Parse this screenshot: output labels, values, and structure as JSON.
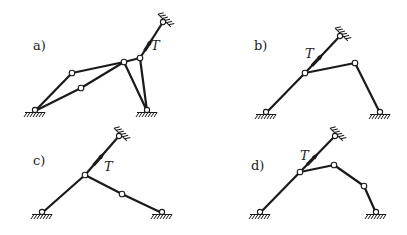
{
  "figure": {
    "panels": [
      {
        "id": "a",
        "label": "a)",
        "label_pos": [
          33,
          50
        ],
        "force_label": "T",
        "force_label_pos": [
          151,
          50
        ],
        "top_support": [
          163,
          22
        ],
        "links": [
          [
            [
              35,
              111
            ],
            [
              72,
              73
            ]
          ],
          [
            [
              72,
              73
            ],
            [
              124,
              62
            ]
          ],
          [
            [
              35,
              111
            ],
            [
              81,
              88
            ]
          ],
          [
            [
              81,
              88
            ],
            [
              124,
              62
            ]
          ],
          [
            [
              124,
              62
            ],
            [
              147,
              111
            ]
          ],
          [
            [
              140,
              58
            ],
            [
              147,
              111
            ]
          ],
          [
            [
              124,
              62
            ],
            [
              140,
              58
            ]
          ],
          [
            [
              140,
              58
            ],
            [
              163,
              22
            ]
          ]
        ],
        "joints": [
          [
            72,
            73
          ],
          [
            81,
            88
          ],
          [
            124,
            62
          ],
          [
            140,
            58
          ]
        ],
        "grounds": [
          [
            35,
            111
          ],
          [
            147,
            111
          ]
        ],
        "arrow": {
          "from": [
            140,
            58
          ],
          "to": [
            163,
            22
          ],
          "t": 0.45
        }
      },
      {
        "id": "b",
        "label": "b)",
        "label_pos": [
          254,
          50
        ],
        "force_label": "T",
        "force_label_pos": [
          305,
          58
        ],
        "top_support": [
          340,
          36
        ],
        "links": [
          [
            [
              266,
              113
            ],
            [
              305,
              73
            ]
          ],
          [
            [
              305,
              73
            ],
            [
              340,
              36
            ]
          ],
          [
            [
              305,
              73
            ],
            [
              355,
              63
            ]
          ],
          [
            [
              355,
              63
            ],
            [
              380,
              113
            ]
          ]
        ],
        "joints": [
          [
            305,
            73
          ],
          [
            355,
            63
          ]
        ],
        "grounds": [
          [
            266,
            113
          ],
          [
            380,
            113
          ]
        ],
        "arrow": {
          "from": [
            305,
            73
          ],
          "to": [
            340,
            36
          ],
          "t": 0.45
        }
      },
      {
        "id": "c",
        "label": "c)",
        "label_pos": [
          33,
          165
        ],
        "force_label": "T",
        "force_label_pos": [
          104,
          171
        ],
        "top_support": [
          119,
          136
        ],
        "links": [
          [
            [
              42,
              213
            ],
            [
              85,
              175
            ]
          ],
          [
            [
              85,
              175
            ],
            [
              119,
              136
            ]
          ],
          [
            [
              85,
              175
            ],
            [
              122,
              194
            ]
          ],
          [
            [
              122,
              194
            ],
            [
              162,
              213
            ]
          ]
        ],
        "joints": [
          [
            85,
            175
          ],
          [
            122,
            194
          ]
        ],
        "grounds": [
          [
            42,
            213
          ],
          [
            162,
            213
          ]
        ],
        "arrow": {
          "from": [
            85,
            175
          ],
          "to": [
            119,
            136
          ],
          "t": 0.5
        }
      },
      {
        "id": "d",
        "label": "d)",
        "label_pos": [
          251,
          170
        ],
        "force_label": "T",
        "force_label_pos": [
          300,
          160
        ],
        "top_support": [
          335,
          136
        ],
        "links": [
          [
            [
              260,
              213
            ],
            [
              300,
              172
            ]
          ],
          [
            [
              300,
              172
            ],
            [
              335,
              136
            ]
          ],
          [
            [
              300,
              172
            ],
            [
              334,
              165
            ]
          ],
          [
            [
              334,
              165
            ],
            [
              364,
              186
            ]
          ],
          [
            [
              364,
              186
            ],
            [
              376,
              213
            ]
          ]
        ],
        "joints": [
          [
            300,
            172
          ],
          [
            334,
            165
          ],
          [
            364,
            186
          ]
        ],
        "grounds": [
          [
            260,
            213
          ],
          [
            376,
            213
          ]
        ],
        "arrow": {
          "from": [
            300,
            172
          ],
          "to": [
            335,
            136
          ],
          "t": 0.45
        }
      }
    ]
  }
}
